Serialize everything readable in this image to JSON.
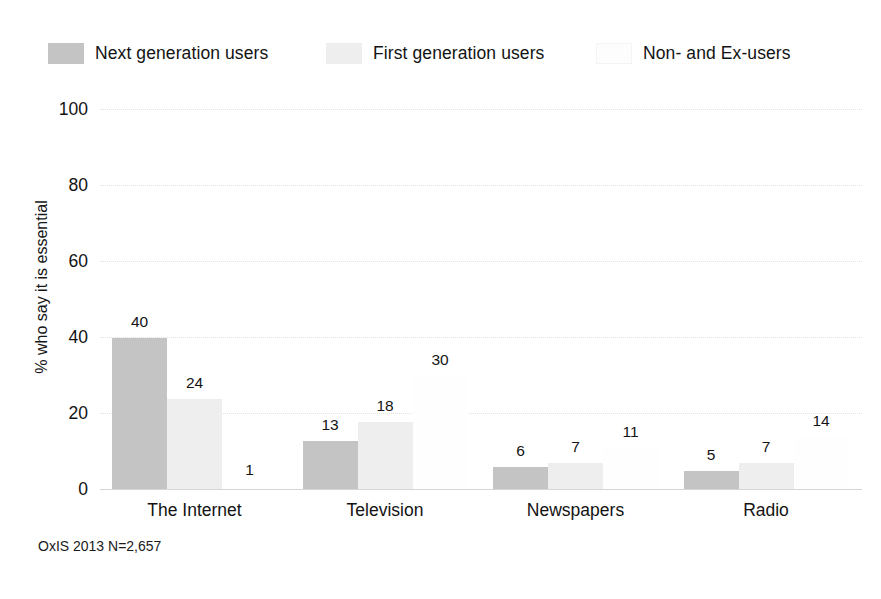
{
  "chart_data": {
    "type": "bar",
    "title": "",
    "subtitle": "",
    "xlabel": "",
    "ylabel": "% who say it is essential",
    "categories": [
      "The Internet",
      "Television",
      "Newspapers",
      "Radio"
    ],
    "series": [
      {
        "name": "Next generation users",
        "color": "#c4c4c4",
        "values": [
          40,
          13,
          6,
          5
        ]
      },
      {
        "name": "First generation users",
        "color": "#eeeeee",
        "values": [
          24,
          18,
          7,
          7
        ]
      },
      {
        "name": "Non- and Ex-users",
        "color": "#fdfdfd",
        "values": [
          1,
          30,
          11,
          14
        ]
      }
    ],
    "ylim": [
      0,
      100
    ],
    "yticks": [
      0,
      20,
      40,
      60,
      80,
      100
    ],
    "ytick_labels": [
      "0",
      "20",
      "40",
      "60",
      "80",
      "100"
    ],
    "grid": true,
    "grid_axis": "y",
    "legend_position": "top",
    "data_labels": true,
    "source_note": "OxIS 2013 N=2,657"
  },
  "legend": {
    "items": [
      {
        "label": "Next generation users",
        "swatch": "#c4c4c4"
      },
      {
        "label": "First generation users",
        "swatch": "#eeeeee"
      },
      {
        "label": "Non- and Ex-users",
        "swatch": "#fdfdfd"
      }
    ]
  },
  "footnote": {
    "text": "OxIS 2013 N=2,657"
  }
}
